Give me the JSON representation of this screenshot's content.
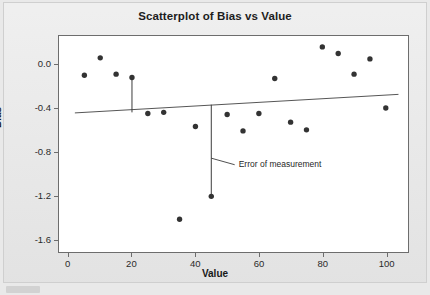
{
  "figure": {
    "title": "Scatterplot of Bias vs Value",
    "background_color": "#e7e7e7",
    "plot_background_color": "#ffffff",
    "frame_color": "#6d6d6d",
    "marker_color": "#333333",
    "line_color": "#555555"
  },
  "chart_data": {
    "type": "scatter",
    "title": "Scatterplot of Bias vs Value",
    "xlabel": "Value",
    "ylabel": "Bias",
    "xlim": [
      -3,
      107
    ],
    "ylim": [
      -1.72,
      0.26
    ],
    "xticks": [
      0,
      20,
      40,
      60,
      80,
      100
    ],
    "xtick_labels": [
      "0",
      "20",
      "40",
      "60",
      "80",
      "100"
    ],
    "yticks": [
      0.0,
      -0.4,
      -0.8,
      -1.2,
      -1.6
    ],
    "ytick_labels": [
      "0.0",
      "-0.4",
      "-0.8",
      "-1.2",
      "-1.6"
    ],
    "grid": false,
    "legend": null,
    "x": [
      5,
      10,
      15,
      20,
      25,
      30,
      35,
      40,
      45,
      50,
      55,
      60,
      65,
      70,
      75,
      80,
      85,
      90,
      95,
      100
    ],
    "y": [
      -0.1,
      0.06,
      -0.09,
      -0.12,
      -0.45,
      -0.44,
      -1.42,
      -0.57,
      -1.21,
      -0.46,
      -0.61,
      -0.45,
      -0.13,
      -0.53,
      -0.6,
      0.16,
      0.1,
      -0.09,
      0.05,
      -0.4
    ],
    "series": [
      {
        "name": "Bias",
        "marker": "circle",
        "points": [
          {
            "x": 5,
            "y": -0.1
          },
          {
            "x": 10,
            "y": 0.06
          },
          {
            "x": 15,
            "y": -0.09
          },
          {
            "x": 20,
            "y": -0.12
          },
          {
            "x": 25,
            "y": -0.45
          },
          {
            "x": 30,
            "y": -0.44
          },
          {
            "x": 35,
            "y": -1.42
          },
          {
            "x": 40,
            "y": -0.57
          },
          {
            "x": 45,
            "y": -1.21
          },
          {
            "x": 50,
            "y": -0.46
          },
          {
            "x": 55,
            "y": -0.61
          },
          {
            "x": 60,
            "y": -0.45
          },
          {
            "x": 65,
            "y": -0.13
          },
          {
            "x": 70,
            "y": -0.53
          },
          {
            "x": 75,
            "y": -0.6
          },
          {
            "x": 80,
            "y": 0.16
          },
          {
            "x": 85,
            "y": 0.1
          },
          {
            "x": 90,
            "y": -0.09
          },
          {
            "x": 95,
            "y": 0.05
          },
          {
            "x": 100,
            "y": -0.4
          }
        ]
      }
    ],
    "fit_line": {
      "name": "regression-line",
      "x_start": 2,
      "y_start": -0.445,
      "x_end": 104,
      "y_end": -0.275
    },
    "error_bars": [
      {
        "x": 20,
        "y_top": -0.12,
        "y_bottom": -0.44,
        "label": null
      },
      {
        "x": 45,
        "y_top": -0.37,
        "y_bottom": -1.21,
        "label": "Error of measurement"
      }
    ],
    "annotations": [
      {
        "text": "Error of measurement",
        "x": 53,
        "y": -0.92,
        "leader_from_x": 45,
        "leader_from_y": -0.86
      }
    ]
  },
  "axes": {
    "y_ticks": [
      {
        "label": "0.0",
        "value": 0.0
      },
      {
        "label": "-0.4",
        "value": -0.4
      },
      {
        "label": "-0.8",
        "value": -0.8
      },
      {
        "label": "-1.2",
        "value": -1.2
      },
      {
        "label": "-1.6",
        "value": -1.6
      }
    ],
    "x_ticks": [
      {
        "label": "0",
        "value": 0
      },
      {
        "label": "20",
        "value": 20
      },
      {
        "label": "40",
        "value": 40
      },
      {
        "label": "60",
        "value": 60
      },
      {
        "label": "80",
        "value": 80
      },
      {
        "label": "100",
        "value": 100
      }
    ]
  }
}
